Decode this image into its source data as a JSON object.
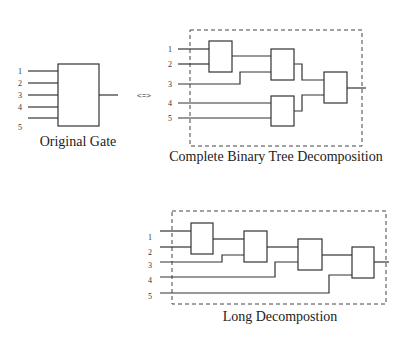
{
  "original": {
    "caption": "Original Gate",
    "inputs": [
      "1",
      "2",
      "3",
      "4",
      "5"
    ]
  },
  "equivalence_symbol": "<=>",
  "binary_tree": {
    "caption": "Complete Binary Tree Decomposition",
    "inputs": [
      "1",
      "2",
      "3",
      "4",
      "5"
    ]
  },
  "long": {
    "caption": "Long Decompostion",
    "inputs": [
      "1",
      "2",
      "3",
      "4",
      "5"
    ]
  }
}
